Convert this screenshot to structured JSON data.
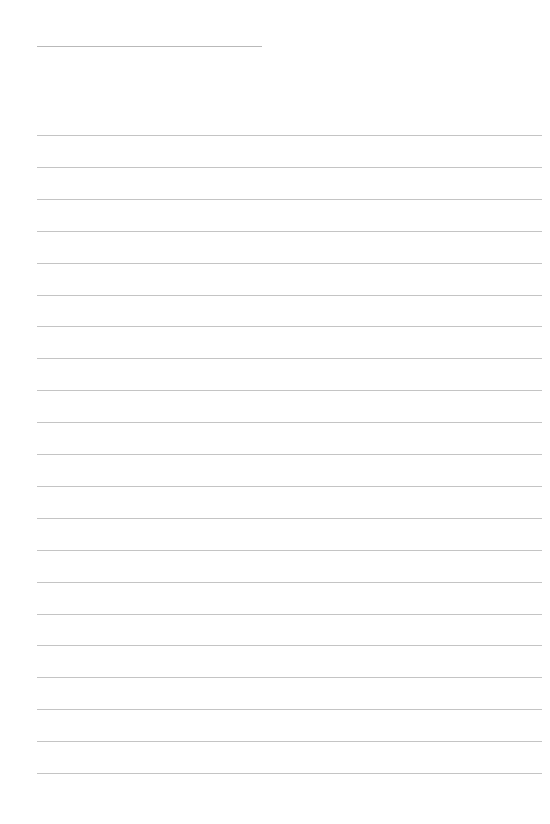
{
  "page": {
    "type": "lined-paper",
    "background_color": "#ffffff",
    "line_color": "#c4c4c4"
  },
  "header_line": {
    "x": 37,
    "y": 46,
    "width": 225
  },
  "rules": {
    "count": 21,
    "start_y": 135,
    "spacing": 31.9,
    "x": 37,
    "width": 505
  }
}
